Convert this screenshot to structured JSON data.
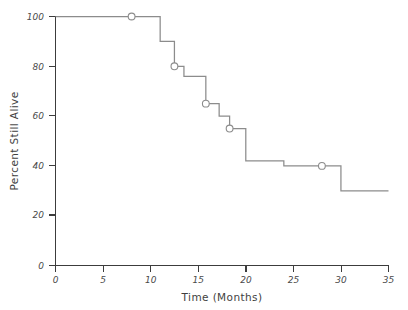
{
  "chart_data": {
    "type": "line",
    "subtype": "kaplan-meier-step",
    "title": "",
    "xlabel": "Time (Months)",
    "ylabel": "Percent Still Alive",
    "xlim": [
      0,
      35
    ],
    "ylim": [
      0,
      100
    ],
    "xticks": [
      0,
      5,
      10,
      15,
      20,
      25,
      30,
      35
    ],
    "xtick_labels": [
      "0",
      "5",
      "10",
      "15",
      "20",
      "25",
      "30",
      "35"
    ],
    "yticks": [
      0,
      20,
      40,
      60,
      80,
      100
    ],
    "ytick_labels": [
      "0",
      "20",
      "40",
      "60",
      "80",
      "100"
    ],
    "grid": false,
    "legend": false,
    "line_color": "#8c8c8c",
    "axis_color": "#3c3c3c",
    "text_color": "#4a4a4a",
    "series": [
      {
        "name": "Survival",
        "x": [
          0,
          11,
          11,
          12.5,
          12.5,
          13.5,
          13.5,
          15.8,
          15.8,
          17.2,
          17.2,
          18.3,
          18.3,
          20.0,
          20.0,
          24.0,
          24.0,
          30.0,
          30.0,
          35.0
        ],
        "values": [
          100,
          100,
          90,
          90,
          80,
          80,
          76,
          76,
          65,
          65,
          60,
          60,
          55,
          55,
          42,
          42,
          40,
          40,
          30,
          30
        ]
      }
    ],
    "censored_points": [
      {
        "x": 8.0,
        "y": 100
      },
      {
        "x": 12.5,
        "y": 80
      },
      {
        "x": 15.8,
        "y": 65
      },
      {
        "x": 18.3,
        "y": 55
      },
      {
        "x": 28.0,
        "y": 40
      }
    ]
  }
}
